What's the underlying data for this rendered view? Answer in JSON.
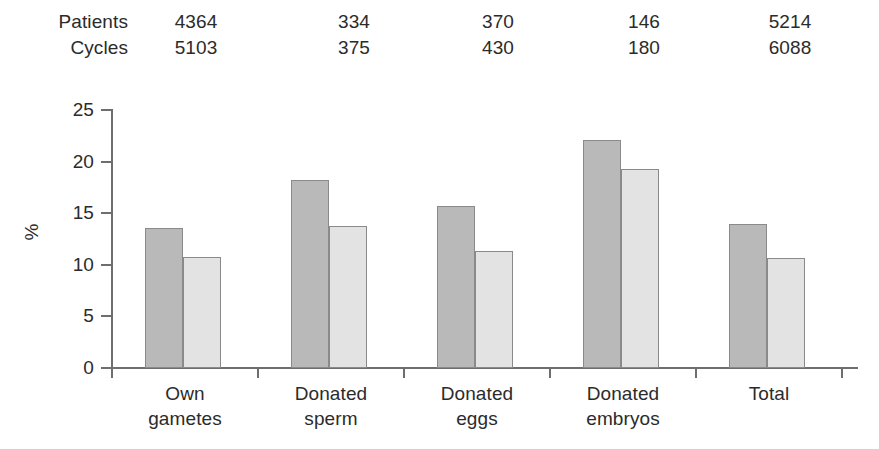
{
  "header": {
    "rows": [
      {
        "label": "Patients",
        "values": [
          "4364",
          "334",
          "370",
          "146",
          "5214"
        ]
      },
      {
        "label": "Cycles",
        "values": [
          "5103",
          "375",
          "430",
          "180",
          "6088"
        ]
      }
    ]
  },
  "chart_data": {
    "type": "bar",
    "title": "",
    "xlabel": "",
    "ylabel": "%",
    "ylim": [
      0,
      25
    ],
    "yticks": [
      0,
      5,
      10,
      15,
      20,
      25
    ],
    "ytick_labels": [
      "0",
      "5",
      "10",
      "15",
      "20",
      "25"
    ],
    "grid": false,
    "legend": "none",
    "categories": [
      "Own gametes",
      "Donated sperm",
      "Donated eggs",
      "Donated embryos",
      "Total"
    ],
    "category_lines": [
      [
        "Own",
        "gametes"
      ],
      [
        "Donated",
        "sperm"
      ],
      [
        "Donated",
        "eggs"
      ],
      [
        "Donated",
        "embryos"
      ],
      [
        "Total",
        ""
      ]
    ],
    "series": [
      {
        "name": "series-1",
        "color": "#b9b9b9",
        "values": [
          13.6,
          18.2,
          15.7,
          22.1,
          14.0
        ]
      },
      {
        "name": "series-2",
        "color": "#e3e3e3",
        "values": [
          10.8,
          13.8,
          11.3,
          19.3,
          10.7
        ]
      }
    ]
  }
}
